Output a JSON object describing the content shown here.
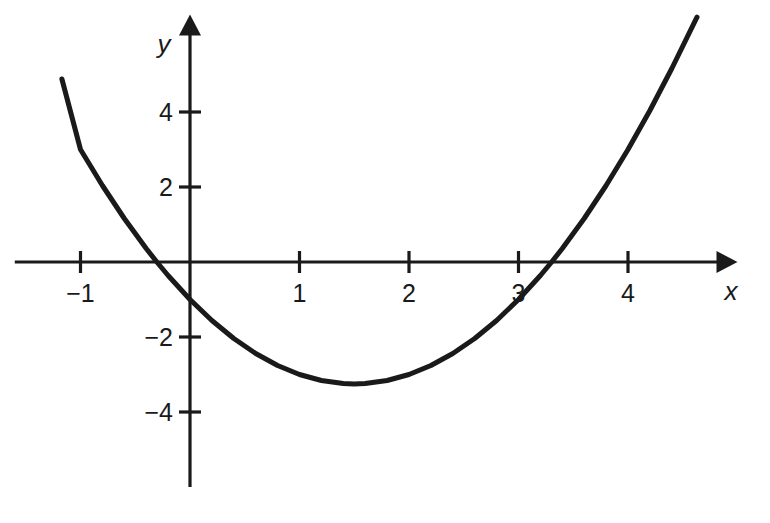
{
  "chart_data": {
    "type": "line",
    "title": "",
    "subtitle": "",
    "xlabel": "x",
    "ylabel": "y",
    "equation": "y = x^2 - 3x - 1",
    "xlim": [
      -1.6,
      5.0
    ],
    "ylim": [
      -6.0,
      6.6
    ],
    "x_ticks": [
      -1,
      1,
      2,
      3,
      4
    ],
    "y_ticks": [
      4,
      2,
      -2,
      -4
    ],
    "x_tick_labels": [
      "−1",
      "1",
      "2",
      "3",
      "4"
    ],
    "y_tick_labels": [
      "4",
      "2",
      "−2",
      "−4"
    ],
    "grid": false,
    "legend": false,
    "legend_position": "none",
    "axis_style": "arrows-both-ends",
    "vertex": [
      1.5,
      -3.25
    ],
    "y_intercept": -1,
    "roots": [
      -0.3028,
      3.3028
    ],
    "x_domain_drawn": [
      -1.17,
      4.63
    ],
    "series": [
      {
        "name": "parabola",
        "color": "#1a1a1a",
        "line_width": 5,
        "x": [
          -1.17,
          -1.0,
          -0.8,
          -0.6,
          -0.4,
          -0.3028,
          -0.2,
          0.0,
          0.2,
          0.4,
          0.6,
          0.8,
          1.0,
          1.2,
          1.4,
          1.5,
          1.6,
          1.8,
          2.0,
          2.2,
          2.4,
          2.6,
          2.8,
          3.0,
          3.2,
          3.3028,
          3.4,
          3.6,
          3.8,
          4.0,
          4.2,
          4.4,
          4.63
        ],
        "y": [
          4.88,
          3.0,
          2.04,
          1.16,
          0.36,
          0.0,
          -0.36,
          -1.0,
          -1.56,
          -2.04,
          -2.44,
          -2.76,
          -3.0,
          -3.16,
          -3.24,
          -3.25,
          -3.24,
          -3.16,
          -3.0,
          -2.76,
          -2.44,
          -2.04,
          -1.56,
          -1.0,
          -0.36,
          0.0,
          0.36,
          1.16,
          2.04,
          3.0,
          4.04,
          5.16,
          6.53
        ]
      }
    ]
  },
  "axes": {
    "x_axis_label": "x",
    "y_axis_label": "y"
  },
  "colors": {
    "curve": "#1a1a1a",
    "axis": "#1a1a1a",
    "background": "#ffffff",
    "text": "#1a1a1a"
  }
}
